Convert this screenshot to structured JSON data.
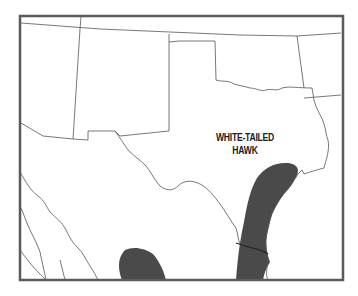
{
  "map": {
    "species_label_line1": "WHITE-TAILED",
    "species_label_line2": "HAWK",
    "colors": {
      "frame": "#5a5a5a",
      "border_lines": "#555555",
      "range_fill": "#4a4a4a",
      "background": "#ffffff"
    },
    "regions_shown": [
      "Texas",
      "Oklahoma",
      "New Mexico",
      "Mexico (northern)"
    ],
    "range_areas": [
      "Texas Gulf Coast / South Texas band",
      "Northeastern Mexico interior patch"
    ]
  }
}
